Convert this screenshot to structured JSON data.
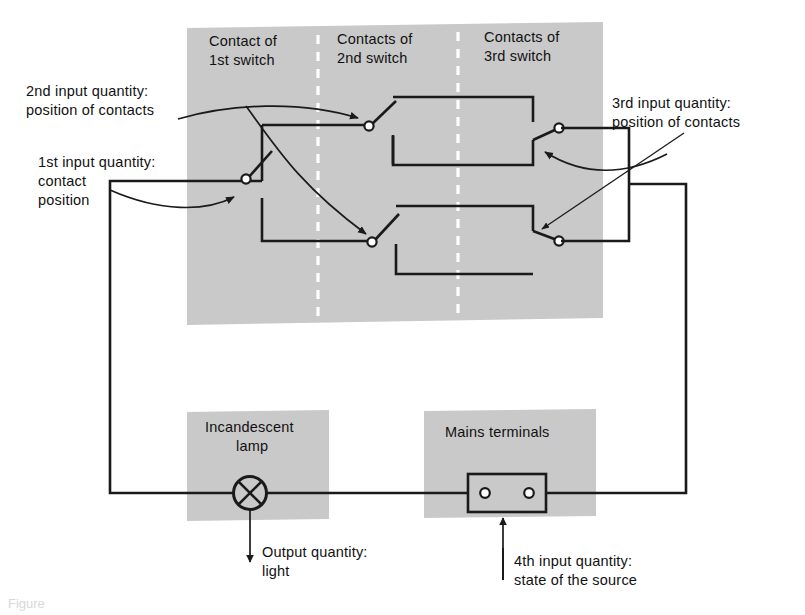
{
  "figure": {
    "domain_label": "circuit-block-diagram",
    "caption": "Figure",
    "colors": {
      "zone_gray": "#c9c9c9",
      "line_black": "#1a1a1a",
      "background": "#ffffff",
      "divider_white": "#ffffff"
    }
  },
  "zone_headers": [
    {
      "line1": "Contact of",
      "line2": "1st switch"
    },
    {
      "line1": "Contacts of",
      "line2": "2nd switch"
    },
    {
      "line1": "Contacts of",
      "line2": "3rd switch"
    }
  ],
  "annotations": {
    "input2": {
      "line1": "2nd input quantity:",
      "line2": "position of contacts"
    },
    "input1": {
      "line1": "1st input quantity:",
      "line2": "contact",
      "line3": "position"
    },
    "input3": {
      "line1": "3rd input quantity:",
      "line2": "position of contacts"
    },
    "input4": {
      "line1": "4th input quantity:",
      "line2": "state of the source"
    },
    "output": {
      "line1": "Output quantity:",
      "line2": "light"
    }
  },
  "components": {
    "lamp": {
      "line1": "Incandescent",
      "line2": "lamp"
    },
    "mains": {
      "label": "Mains terminals"
    }
  }
}
